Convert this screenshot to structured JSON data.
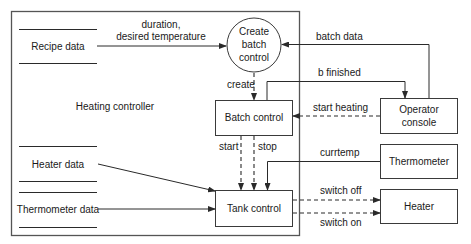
{
  "diagram": {
    "system_boundary_label": "Heating controller",
    "data_stores": [
      {
        "id": "recipe",
        "label": "Recipe data"
      },
      {
        "id": "heater_data",
        "label": "Heater data"
      },
      {
        "id": "thermometer_data",
        "label": "Thermometer data"
      }
    ],
    "processes": [
      {
        "id": "create_batch",
        "label_lines": [
          "Create",
          "batch",
          "control"
        ],
        "shape": "circle"
      },
      {
        "id": "batch_control",
        "label": "Batch control",
        "shape": "box"
      },
      {
        "id": "tank_control",
        "label": "Tank control",
        "shape": "box"
      }
    ],
    "external_entities": [
      {
        "id": "operator",
        "label_lines": [
          "Operator",
          "console"
        ]
      },
      {
        "id": "thermometer",
        "label": "Thermometer"
      },
      {
        "id": "heater",
        "label": "Heater"
      }
    ],
    "flows": {
      "recipe_to_create": {
        "lines": [
          "duration,",
          "desired temperature"
        ],
        "style": "solid"
      },
      "operator_to_create": {
        "label": "batch data",
        "style": "solid"
      },
      "create_to_batch": {
        "label": "create",
        "style": "dashed"
      },
      "batch_to_operator": {
        "label": "b finished",
        "style": "solid"
      },
      "operator_to_batch": {
        "label": "start heating",
        "style": "dashed"
      },
      "batch_to_tank_start": {
        "label": "start",
        "style": "dashed"
      },
      "batch_to_tank_stop": {
        "label": "stop",
        "style": "dashed"
      },
      "thermometer_to_tank": {
        "label": "currtemp",
        "style": "solid"
      },
      "tank_to_heater_off": {
        "label": "switch off",
        "style": "dashed"
      },
      "tank_to_heater_on": {
        "label": "switch on",
        "style": "dashed"
      }
    },
    "colors": {
      "line": "#2a2a2a",
      "text": "#1a1a1a",
      "background": "#ffffff"
    }
  }
}
